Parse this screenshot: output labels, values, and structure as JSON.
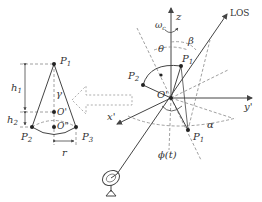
{
  "left_cone": {
    "apex_label": "P",
    "apex_sub": "1",
    "base_left_label": "P",
    "base_left_sub": "2",
    "base_right_label": "P",
    "base_right_sub": "3",
    "center_upper_label": "O'",
    "center_lower_label": "O\"",
    "angle_label": "γ",
    "h1_label": "h",
    "h1_sub": "1",
    "h2_label": "h",
    "h2_sub": "2",
    "radius_label": "r"
  },
  "right_frame": {
    "z_label": "z",
    "omega_label": "ω",
    "omega_sub": "c",
    "los_label": "LOS",
    "theta_label": "θ",
    "beta_label": "β",
    "p1_label": "P",
    "p1_sub": "1",
    "p2_label": "P",
    "p2_sub": "2",
    "p1b_label": "P",
    "p1b_sub": "1",
    "origin_label": "O'",
    "y_label": "y'",
    "x_label": "x'",
    "alpha_label": "α",
    "phi_label": "ϕ(t)"
  },
  "colors": {
    "line": "#444444",
    "dashed": "#888888",
    "text": "#333333"
  }
}
